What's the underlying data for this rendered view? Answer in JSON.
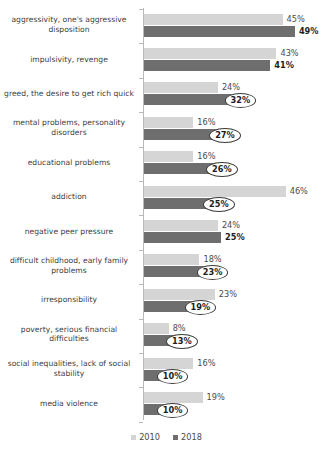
{
  "chart_data": {
    "type": "bar",
    "orientation": "horizontal",
    "title": "",
    "xlabel": "",
    "ylabel": "",
    "xlim": [
      0,
      50
    ],
    "grid": false,
    "legend_position": "bottom-center",
    "categories": [
      "aggressivity, one's aggressive disposition",
      "impulsivity, revenge",
      "greed, the desire to get rich quick",
      "mental problems, personality disorders",
      "educational problems",
      "addiction",
      "negative peer pressure",
      "difficult childhood, early family problems",
      "irresponsibility",
      "poverty, serious financial difficulties",
      "social inequalities, lack of social stability",
      "media violence"
    ],
    "series": [
      {
        "name": "2010",
        "color": "#d5d5d5",
        "values": [
          45,
          43,
          24,
          16,
          16,
          46,
          24,
          18,
          23,
          8,
          16,
          19
        ],
        "labels": [
          "45%",
          "43%",
          "24%",
          "16%",
          "16%",
          "46%",
          "24%",
          "18%",
          "23%",
          "8%",
          "16%",
          "19%"
        ]
      },
      {
        "name": "2018",
        "color": "#6e6e6e",
        "values": [
          49,
          41,
          32,
          27,
          26,
          25,
          25,
          23,
          19,
          13,
          10,
          10
        ],
        "labels": [
          "49%",
          "41%",
          "32%",
          "27%",
          "26%",
          "25%",
          "25%",
          "23%",
          "19%",
          "13%",
          "10%",
          "10%"
        ],
        "label_styles": [
          "outside",
          "outside",
          "oval",
          "oval",
          "oval",
          "oval",
          "outside",
          "oval",
          "oval",
          "oval",
          "oval",
          "oval"
        ]
      }
    ]
  },
  "legend": {
    "items": [
      {
        "label": "2010"
      },
      {
        "label": "2018"
      }
    ]
  }
}
